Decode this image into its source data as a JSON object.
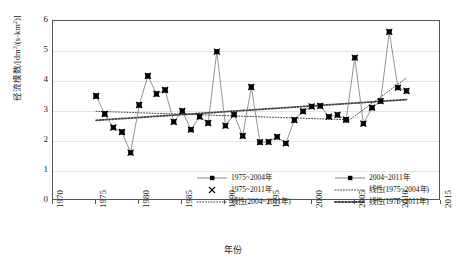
{
  "chart_data": {
    "type": "line",
    "title": "",
    "xlabel": "年份",
    "ylabel": "径流模数/[dm³/(s·km²)]",
    "ylabel_parts": {
      "main": "径流模数/[dm",
      "sup1": "3",
      "mid": "/(s·km",
      "sup2": "2",
      "end": ")]"
    },
    "xlim": [
      1970,
      2015
    ],
    "ylim": [
      0,
      6
    ],
    "xticks": [
      1970,
      1975,
      1980,
      1985,
      1990,
      1995,
      2000,
      2005,
      2010,
      2015
    ],
    "yticks": [
      0,
      1,
      2,
      3,
      4,
      5,
      6
    ],
    "grid": "horizontal",
    "legend_position": "inside-lower-center",
    "x": [
      1975,
      1976,
      1977,
      1978,
      1979,
      1980,
      1981,
      1982,
      1983,
      1984,
      1985,
      1986,
      1987,
      1988,
      1989,
      1990,
      1991,
      1992,
      1993,
      1994,
      1995,
      1996,
      1997,
      1998,
      1999,
      2000,
      2001,
      2002,
      2003,
      2004,
      2005,
      2006,
      2007,
      2008,
      2009,
      2010,
      2011
    ],
    "series": [
      {
        "name": "1975~2004年",
        "marker": "square-dot",
        "values": [
          3.5,
          2.9,
          2.45,
          2.3,
          1.61,
          3.2,
          4.17,
          3.57,
          3.7,
          2.64,
          3.0,
          2.38,
          2.81,
          2.6,
          4.98,
          2.51,
          2.88,
          2.17,
          3.8,
          1.96,
          1.97,
          2.14,
          1.92,
          2.7,
          2.99,
          3.15,
          3.17,
          2.81,
          2.87,
          2.71,
          null,
          null,
          null,
          null,
          null,
          null,
          null
        ]
      },
      {
        "name": "2004~2011年",
        "marker": "square-dot",
        "values": [
          null,
          null,
          null,
          null,
          null,
          null,
          null,
          null,
          null,
          null,
          null,
          null,
          null,
          null,
          null,
          null,
          null,
          null,
          null,
          null,
          null,
          null,
          null,
          null,
          null,
          null,
          null,
          null,
          null,
          2.71,
          4.78,
          2.58,
          3.11,
          3.33,
          5.64,
          3.78,
          3.67
        ]
      },
      {
        "name": "1975~2011年",
        "marker": "cross",
        "values": [
          3.5,
          2.9,
          2.45,
          2.3,
          1.61,
          3.2,
          4.17,
          3.57,
          3.7,
          2.64,
          3.0,
          2.38,
          2.81,
          2.6,
          4.98,
          2.51,
          2.88,
          2.17,
          3.8,
          1.96,
          1.97,
          2.14,
          1.92,
          2.7,
          2.99,
          3.15,
          3.17,
          2.81,
          2.87,
          2.71,
          4.78,
          2.58,
          3.11,
          3.33,
          5.64,
          3.78,
          3.67
        ]
      }
    ],
    "trendlines": [
      {
        "name": "线性(1975~2004年)",
        "style": "fine-dotted",
        "x0": 1975,
        "y0": 2.99,
        "x1": 2004,
        "y1": 2.71
      },
      {
        "name": "线性(2004~2011年)",
        "style": "fine-dotted",
        "x0": 2004,
        "y0": 2.62,
        "x1": 2011,
        "y1": 4.1
      },
      {
        "name": "线性(1975~2011年)",
        "style": "bold-dotted",
        "x0": 1975,
        "y0": 2.69,
        "x1": 2011,
        "y1": 3.38
      }
    ]
  },
  "legend": {
    "entries": [
      {
        "label": "1975~2004年",
        "key": "line-square-marker"
      },
      {
        "label": "2004~2011年",
        "key": "line-square-marker"
      },
      {
        "label": "1975~2011年",
        "key": "cross-marker"
      },
      {
        "label": "线性(1975~2004年)",
        "key": "fine-dotted-line"
      },
      {
        "label": "线性(2004~2011年)",
        "key": "fine-dotted-line"
      },
      {
        "label": "线性(1975~2011年)",
        "key": "bold-dotted-line"
      }
    ]
  },
  "axis": {
    "y_tick_labels": [
      "6",
      "5",
      "4",
      "3",
      "2",
      "1",
      "0"
    ],
    "x_tick_labels": [
      "1970",
      "1975",
      "1980",
      "1985",
      "1990",
      "1995",
      "2000",
      "2005",
      "2010",
      "2015"
    ],
    "x_title": "年份"
  },
  "colors": {
    "series_line": "#777777",
    "marker": "#000000",
    "trend": "#444444",
    "grid": "#e4e4e4",
    "frame": "#555555"
  }
}
